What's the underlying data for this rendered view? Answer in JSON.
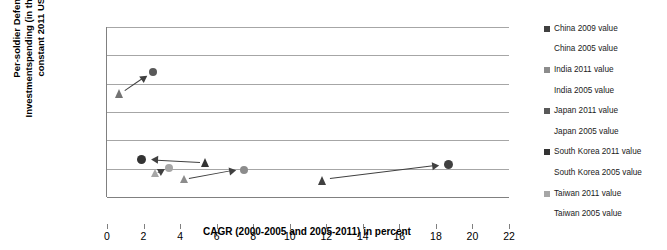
{
  "chart_data": {
    "type": "scatter",
    "title": "",
    "xlabel": "CAGR (2000-2005 and 2005-2011) in percent",
    "ylabel_line1": "Per-soldier Defense",
    "ylabel_line2": "Investmentspending (in thousands of",
    "ylabel_line3": "constant 2011 US$)",
    "xlim": [
      0,
      22
    ],
    "ylim": [
      0,
      60
    ],
    "xticks": [
      0,
      2,
      4,
      6,
      8,
      10,
      12,
      14,
      16,
      18,
      20,
      22
    ],
    "yticks": [
      0,
      10,
      20,
      30,
      40,
      50,
      60
    ],
    "grid": true,
    "legend_position": "right",
    "series": [
      {
        "name": "China 2009 value",
        "marker": "circle",
        "color": "#404040",
        "size": 9,
        "x": 18.7,
        "y": 11.3
      },
      {
        "name": "China 2005 value",
        "marker": "triangle",
        "color": "#404040",
        "size": 9,
        "x": 11.8,
        "y": 6.0
      },
      {
        "name": "India 2011 value",
        "marker": "circle",
        "color": "#8c8c8c",
        "size": 8,
        "x": 7.5,
        "y": 9.7
      },
      {
        "name": "India 2005 value",
        "marker": "triangle",
        "color": "#8c8c8c",
        "size": 8,
        "x": 4.2,
        "y": 6.2
      },
      {
        "name": "Japan 2011 value",
        "marker": "circle",
        "color": "#595959",
        "size": 8,
        "x": 2.5,
        "y": 44.0
      },
      {
        "name": "Japan 2005 value",
        "marker": "triangle",
        "color": "#737373",
        "size": 9,
        "x": 0.7,
        "y": 36.5
      },
      {
        "name": "South Korea 2011 value",
        "marker": "circle",
        "color": "#333333",
        "size": 9,
        "x": 1.9,
        "y": 13.4
      },
      {
        "name": "South Korea 2005 value",
        "marker": "triangle",
        "color": "#333333",
        "size": 9,
        "x": 5.4,
        "y": 12.3
      },
      {
        "name": "Taiwan 2011 value",
        "marker": "circle",
        "color": "#a6a6a6",
        "size": 8,
        "x": 3.4,
        "y": 10.4
      },
      {
        "name": "Taiwan 2005 value",
        "marker": "triangle",
        "color": "#a6a6a6",
        "size": 8,
        "x": 2.6,
        "y": 8.4
      }
    ],
    "arrows": [
      {
        "name": "japan-arrow",
        "x1": 1.0,
        "y1": 37.3,
        "x2": 2.2,
        "y2": 42.6
      },
      {
        "name": "south-korea-arrow",
        "x1": 5.1,
        "y1": 12.3,
        "x2": 2.4,
        "y2": 13.2
      },
      {
        "name": "taiwan-arrow",
        "x1": 2.8,
        "y1": 8.4,
        "x2": 3.2,
        "y2": 9.9
      },
      {
        "name": "india-arrow",
        "x1": 4.5,
        "y1": 6.3,
        "x2": 7.1,
        "y2": 9.4
      },
      {
        "name": "china-arrow",
        "x1": 12.2,
        "y1": 6.3,
        "x2": 18.2,
        "y2": 11.1
      }
    ]
  },
  "colors": {
    "gridline": "#a6a6a6",
    "axis": "#808080",
    "arrow": "#404040"
  }
}
